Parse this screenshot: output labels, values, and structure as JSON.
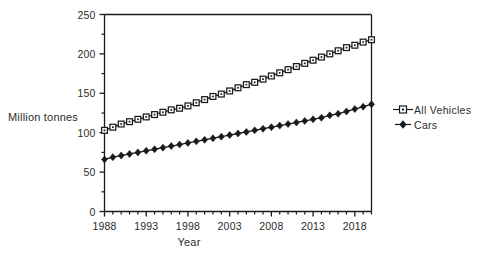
{
  "chart_data": {
    "type": "line",
    "title": "",
    "xlabel": "Year",
    "ylabel": "Million tonnes",
    "xlim": [
      1988,
      2020
    ],
    "ylim": [
      0,
      250
    ],
    "grid": false,
    "legend_position": "right",
    "y_ticks": [
      0,
      50,
      100,
      150,
      200,
      250
    ],
    "y_tick_labels": [
      "0",
      "50",
      "100",
      "150",
      "200",
      "250"
    ],
    "y_minor_tick_interval": 25,
    "x_ticks": [
      1988,
      1993,
      1998,
      2003,
      2008,
      2013,
      2018
    ],
    "x_tick_labels": [
      "1988",
      "1993",
      "1998",
      "2003",
      "2008",
      "2013",
      "2018"
    ],
    "x": [
      1988,
      1989,
      1990,
      1991,
      1992,
      1993,
      1994,
      1995,
      1996,
      1997,
      1998,
      1999,
      2000,
      2001,
      2002,
      2003,
      2004,
      2005,
      2006,
      2007,
      2008,
      2009,
      2010,
      2011,
      2012,
      2013,
      2014,
      2015,
      2016,
      2017,
      2018,
      2019,
      2020
    ],
    "series": [
      {
        "name": "All Vehicles",
        "marker": "open-square",
        "color": "#1a1a1a",
        "values": [
          103,
          107,
          111,
          114,
          117,
          120,
          123,
          126,
          129,
          131,
          134,
          138,
          142,
          146,
          149,
          153,
          157,
          161,
          164,
          168,
          172,
          176,
          180,
          184,
          188,
          192,
          196,
          200,
          204,
          208,
          211,
          215,
          218
        ]
      },
      {
        "name": "Cars",
        "marker": "filled-diamond",
        "color": "#1a1a1a",
        "values": [
          66,
          69,
          71,
          73,
          75,
          77,
          79,
          81,
          83,
          85,
          87,
          89,
          91,
          93,
          95,
          97,
          99,
          101,
          103,
          105,
          107,
          109,
          111,
          113,
          115,
          117,
          119,
          122,
          124,
          127,
          130,
          133,
          136
        ]
      }
    ]
  },
  "legend": {
    "items": [
      {
        "label": "All Vehicles"
      },
      {
        "label": "Cars"
      }
    ]
  },
  "axes": {
    "y_title": "Million tonnes",
    "x_title": "Year"
  }
}
